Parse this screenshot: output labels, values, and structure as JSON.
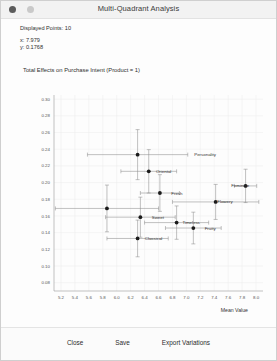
{
  "window": {
    "title": "Multi-Quadrant Analysis",
    "close_dot": "close-dot",
    "minimize_dot": "minimize-dot"
  },
  "info": {
    "displayed_points_label": "Displayed Points: 10",
    "x_readout": "x: 7.979",
    "y_readout": "y: 0.1768"
  },
  "footer": {
    "close_label": "Close",
    "save_label": "Save",
    "export_label": "Export Variations"
  },
  "chart_data": {
    "type": "scatter",
    "title": "Total Effects on Purchase Intent (Product = 1)",
    "xlabel": "Mean Value",
    "ylabel": "",
    "xlim": [
      5.1,
      8.1
    ],
    "ylim": [
      0.07,
      0.305
    ],
    "grid": true,
    "legend": "none",
    "xticks": [
      5.2,
      5.4,
      5.6,
      5.8,
      6.0,
      6.2,
      6.4,
      6.6,
      6.8,
      7.0,
      7.2,
      7.4,
      7.6,
      7.8,
      8.0
    ],
    "yticks": [
      0.08,
      0.1,
      0.12,
      0.14,
      0.16,
      0.18,
      0.2,
      0.22,
      0.24,
      0.26,
      0.28,
      0.3
    ],
    "points": [
      {
        "label": "Personality",
        "x": 6.3,
        "y": 0.2335,
        "xerr": 0.72,
        "yerr": 0.03,
        "label_x": 7.07,
        "label_side": "right"
      },
      {
        "label": "Oriental",
        "x": 6.46,
        "y": 0.2135,
        "xerr": 0.4,
        "yerr": 0.026,
        "label_x": 6.52,
        "label_side": "right"
      },
      {
        "label": "Feminine",
        "x": 7.85,
        "y": 0.196,
        "xerr": 0.16,
        "yerr": 0.02,
        "label_x": 7.6,
        "label_side": "right"
      },
      {
        "label": "Fresh",
        "x": 6.62,
        "y": 0.1875,
        "xerr": 0.28,
        "yerr": 0.022,
        "label_x": 6.74,
        "label_side": "right"
      },
      {
        "label": "Flowery",
        "x": 7.42,
        "y": 0.1768,
        "xerr": 0.62,
        "yerr": 0.021,
        "label_x": 7.4,
        "label_side": "right"
      },
      {
        "label": "Sweet",
        "x": 6.34,
        "y": 0.1585,
        "xerr": 0.5,
        "yerr": 0.024,
        "label_x": 6.46,
        "label_side": "right"
      },
      {
        "label": "Timeless",
        "x": 6.86,
        "y": 0.152,
        "xerr": 0.46,
        "yerr": 0.02,
        "label_x": 6.9,
        "label_side": "right"
      },
      {
        "label": "Fruity",
        "x": 7.1,
        "y": 0.1455,
        "xerr": 0.4,
        "yerr": 0.019,
        "label_x": 7.22,
        "label_side": "right"
      },
      {
        "label": "Classical",
        "x": 6.3,
        "y": 0.133,
        "xerr": 0.44,
        "yerr": 0.022,
        "label_x": 6.36,
        "label_side": "right"
      },
      {
        "label": "",
        "x": 5.86,
        "y": 0.169,
        "xerr": 0.74,
        "yerr": 0.028,
        "label_x": 5.86,
        "label_side": "right"
      }
    ]
  }
}
